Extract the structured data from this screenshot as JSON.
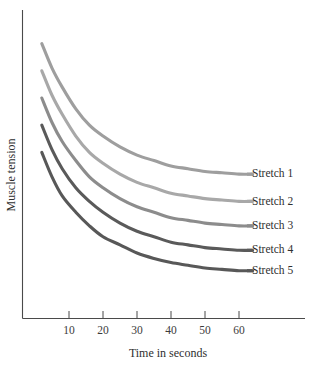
{
  "chart_data": {
    "type": "line",
    "title": "",
    "xlabel": "Time in seconds",
    "ylabel": "Muscle tension",
    "xlim": [
      0,
      70
    ],
    "ylim": [
      0,
      100
    ],
    "grid": false,
    "legend_position": "right-inline",
    "x_ticks": [
      "10",
      "20",
      "30",
      "40",
      "50",
      "60"
    ],
    "x_tick_values": [
      10,
      20,
      30,
      40,
      50,
      60
    ],
    "y_ticks": [],
    "x": [
      2,
      5,
      8,
      12,
      16,
      20,
      25,
      30,
      35,
      40,
      45,
      50,
      55,
      60,
      64
    ],
    "series": [
      {
        "name": "Stretch 1",
        "color": "#9e9e9e",
        "values": [
          95,
          86,
          79,
          71,
          65,
          61,
          57,
          54,
          52,
          50,
          49,
          48,
          47.5,
          47,
          47
        ]
      },
      {
        "name": "Stretch 2",
        "color": "#a8a8a8",
        "values": [
          85,
          76,
          69,
          61,
          55,
          51,
          47,
          44,
          42,
          40,
          39,
          38,
          37.5,
          37,
          37
        ]
      },
      {
        "name": "Stretch 3",
        "color": "#8c8c8c",
        "values": [
          75,
          66,
          59,
          52,
          46,
          42,
          38,
          35,
          33,
          31,
          30,
          29,
          28.5,
          28,
          28
        ]
      },
      {
        "name": "Stretch 4",
        "color": "#5a5a5a",
        "values": [
          65,
          56,
          49,
          42,
          37,
          33,
          29,
          26,
          24,
          22,
          21,
          20,
          19.5,
          19,
          19
        ]
      },
      {
        "name": "Stretch 5",
        "color": "#585858",
        "values": [
          55,
          46,
          39,
          33,
          28,
          24,
          21,
          18,
          16,
          14.5,
          13.5,
          12.5,
          12,
          11.5,
          11.5
        ]
      }
    ]
  },
  "legend": {
    "items": [
      {
        "label": "Stretch 1"
      },
      {
        "label": "Stretch 2"
      },
      {
        "label": "Stretch 3"
      },
      {
        "label": "Stretch 4"
      },
      {
        "label": "Stretch 5"
      }
    ]
  },
  "axes": {
    "x_title": "Time in seconds",
    "y_title": "Muscle tension",
    "x_tick_labels": [
      "10",
      "20",
      "30",
      "40",
      "50",
      "60"
    ]
  },
  "colors": {
    "axis": "#4a4a4a",
    "text": "#2f2f2f",
    "background": "#ffffff"
  }
}
